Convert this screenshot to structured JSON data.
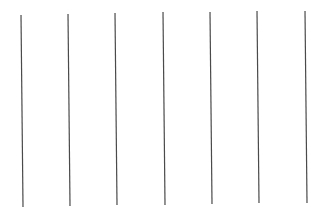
{
  "canvas": {
    "width": 328,
    "height": 213,
    "background": "#ffffff"
  },
  "lines": {
    "color": "#4a4a4a",
    "stroke_width": 1.2,
    "items": [
      {
        "x1": 21,
        "y1": 15,
        "x2": 23,
        "y2": 207
      },
      {
        "x1": 68,
        "y1": 14,
        "x2": 70,
        "y2": 206
      },
      {
        "x1": 115,
        "y1": 13,
        "x2": 117,
        "y2": 205
      },
      {
        "x1": 163,
        "y1": 12,
        "x2": 165,
        "y2": 205
      },
      {
        "x1": 210,
        "y1": 12,
        "x2": 212,
        "y2": 204
      },
      {
        "x1": 257,
        "y1": 11,
        "x2": 259,
        "y2": 203
      },
      {
        "x1": 305,
        "y1": 11,
        "x2": 307,
        "y2": 203
      }
    ]
  }
}
